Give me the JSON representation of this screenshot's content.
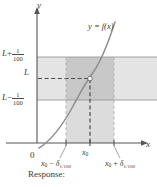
{
  "figure": {
    "type": "epsilon-delta-limit-diagram",
    "caption": "Response:",
    "axes": {
      "x_axis_label": "x",
      "y_axis_label": "y",
      "origin_label": "0"
    },
    "curve_label": "y = f(x)",
    "y_ticks": [
      {
        "id": "upper",
        "base": "L",
        "op": "+",
        "num": "1",
        "den": "100",
        "value_text": "L + 1/100"
      },
      {
        "id": "center",
        "base": "L",
        "op": "",
        "num": "",
        "den": "",
        "value_text": "L"
      },
      {
        "id": "lower",
        "base": "L",
        "op": "−",
        "num": "1",
        "den": "100",
        "value_text": "L − 1/100"
      }
    ],
    "x_ticks": [
      {
        "id": "left",
        "base": "x",
        "sub": "0",
        "op": "−",
        "delta": "δ",
        "delta_sub": "1/100",
        "value_text": "x0 − δ1/100"
      },
      {
        "id": "center",
        "base": "x",
        "sub": "0",
        "op": "",
        "delta": "",
        "delta_sub": "",
        "value_text": "x0"
      },
      {
        "id": "right",
        "base": "x",
        "sub": "0",
        "op": "+",
        "delta": "δ",
        "delta_sub": "1/100",
        "value_text": "x0 + δ1/100"
      }
    ],
    "colors": {
      "band_horizontal": "#e2e2e2",
      "band_vertical": "#d8d8d8",
      "band_overlap": "#c6c6c6",
      "curve": "#8a8a8a",
      "axis": "#555555",
      "dash_dark": "#4a4a4a",
      "dash_light": "#b0b0b0",
      "point_fill": "#ffffff",
      "text": "#3a3a3a"
    },
    "annotations": {
      "intersection_point": "white dot at (x0, L)",
      "horizontal_band": "L ± 1/100 tolerance band",
      "vertical_band": "x0 ± δ1/100 interval"
    }
  }
}
